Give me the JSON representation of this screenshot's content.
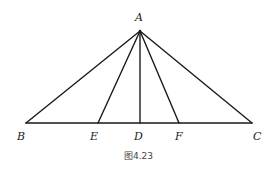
{
  "figure": {
    "caption": "图4.23",
    "colors": {
      "line": "#1a1a1a",
      "label": "#222222"
    },
    "points": {
      "A": {
        "label": "A",
        "x": 140,
        "y": 31,
        "lx": 139,
        "ly": 21
      },
      "B": {
        "label": "B",
        "x": 26,
        "y": 123,
        "lx": 18,
        "ly": 139
      },
      "E": {
        "label": "E",
        "x": 98,
        "y": 123,
        "lx": 93,
        "ly": 139
      },
      "D": {
        "label": "D",
        "x": 140,
        "y": 123,
        "lx": 135,
        "ly": 139
      },
      "F": {
        "label": "F",
        "x": 179,
        "y": 123,
        "lx": 176,
        "ly": 139
      },
      "C": {
        "label": "C",
        "x": 252,
        "y": 123,
        "lx": 254,
        "ly": 139
      }
    },
    "segments": [
      "AB",
      "AE",
      "AD",
      "AF",
      "AC",
      "BC"
    ]
  }
}
